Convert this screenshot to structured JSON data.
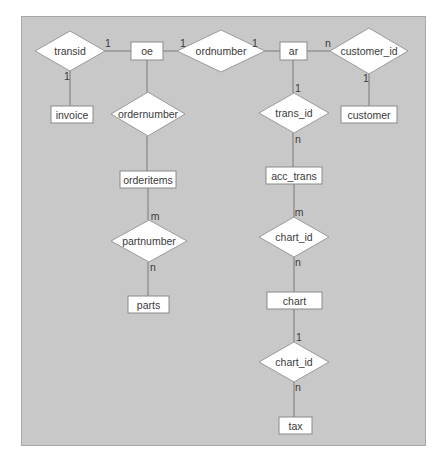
{
  "diagram": {
    "type": "entity-relationship",
    "panel_color": "#c8c8c8",
    "entities": [
      {
        "id": "oe",
        "label": "oe",
        "x": 131,
        "y": 42,
        "w": 32,
        "h": 18
      },
      {
        "id": "ar",
        "label": "ar",
        "x": 280,
        "y": 42,
        "w": 27,
        "h": 18
      },
      {
        "id": "invoice",
        "label": "invoice",
        "x": 51,
        "y": 106,
        "w": 42,
        "h": 17
      },
      {
        "id": "customer",
        "label": "customer",
        "x": 341,
        "y": 106,
        "w": 56,
        "h": 17
      },
      {
        "id": "orderitems",
        "label": "orderitems",
        "x": 120,
        "y": 171,
        "w": 56,
        "h": 17
      },
      {
        "id": "acc_trans",
        "label": "acc_trans",
        "x": 266,
        "y": 167,
        "w": 56,
        "h": 17
      },
      {
        "id": "parts",
        "label": "parts",
        "x": 128,
        "y": 296,
        "w": 41,
        "h": 17
      },
      {
        "id": "chart",
        "label": "chart",
        "x": 267,
        "y": 292,
        "w": 55,
        "h": 17
      },
      {
        "id": "tax",
        "label": "tax",
        "x": 279,
        "y": 417,
        "w": 33,
        "h": 17
      }
    ],
    "relationships": [
      {
        "id": "rel_transid",
        "label": "transid",
        "cx": 70,
        "cy": 51,
        "w": 70,
        "h": 40
      },
      {
        "id": "rel_ordnumber",
        "label": "ordnumber",
        "cx": 221,
        "cy": 51,
        "w": 88,
        "h": 42
      },
      {
        "id": "rel_customer_id",
        "label": "customer_id",
        "cx": 369,
        "cy": 51,
        "w": 78,
        "h": 46
      },
      {
        "id": "rel_ordernumber",
        "label": "ordernumber",
        "cx": 148,
        "cy": 114,
        "w": 74,
        "h": 44
      },
      {
        "id": "rel_trans_id",
        "label": "trans_id",
        "cx": 294,
        "cy": 113,
        "w": 70,
        "h": 40
      },
      {
        "id": "rel_partnumber",
        "label": "partnumber",
        "cx": 149,
        "cy": 241,
        "w": 76,
        "h": 42
      },
      {
        "id": "rel_chart_id_1",
        "label": "chart_id",
        "cx": 294,
        "cy": 237,
        "w": 70,
        "h": 40
      },
      {
        "id": "rel_chart_id_2",
        "label": "chart_id",
        "cx": 294,
        "cy": 362,
        "w": 70,
        "h": 40
      }
    ],
    "edges": [
      {
        "x1": 105,
        "y1": 51,
        "x2": 131,
        "y2": 51
      },
      {
        "x1": 70,
        "y1": 71,
        "x2": 70,
        "y2": 106
      },
      {
        "x1": 163,
        "y1": 51,
        "x2": 177,
        "y2": 51
      },
      {
        "x1": 265,
        "y1": 51,
        "x2": 280,
        "y2": 51
      },
      {
        "x1": 307,
        "y1": 51,
        "x2": 330,
        "y2": 51
      },
      {
        "x1": 369,
        "y1": 74,
        "x2": 369,
        "y2": 106
      },
      {
        "x1": 147,
        "y1": 60,
        "x2": 147,
        "y2": 92
      },
      {
        "x1": 147,
        "y1": 136,
        "x2": 147,
        "y2": 171
      },
      {
        "x1": 293,
        "y1": 60,
        "x2": 293,
        "y2": 93
      },
      {
        "x1": 293,
        "y1": 133,
        "x2": 293,
        "y2": 167
      },
      {
        "x1": 148,
        "y1": 188,
        "x2": 148,
        "y2": 220
      },
      {
        "x1": 148,
        "y1": 262,
        "x2": 148,
        "y2": 296
      },
      {
        "x1": 294,
        "y1": 184,
        "x2": 294,
        "y2": 217
      },
      {
        "x1": 294,
        "y1": 257,
        "x2": 294,
        "y2": 292
      },
      {
        "x1": 294,
        "y1": 309,
        "x2": 294,
        "y2": 342
      },
      {
        "x1": 294,
        "y1": 382,
        "x2": 294,
        "y2": 417
      }
    ],
    "cardinalities": [
      {
        "label": "1",
        "x": 108,
        "y": 43
      },
      {
        "label": "1",
        "x": 67,
        "y": 76
      },
      {
        "label": "1",
        "x": 183,
        "y": 43
      },
      {
        "label": "1",
        "x": 255,
        "y": 43
      },
      {
        "label": "n",
        "x": 328,
        "y": 43
      },
      {
        "label": "1",
        "x": 366,
        "y": 78
      },
      {
        "label": "1",
        "x": 298,
        "y": 88
      },
      {
        "label": "n",
        "x": 298,
        "y": 139
      },
      {
        "label": "m",
        "x": 155,
        "y": 216
      },
      {
        "label": "n",
        "x": 153,
        "y": 267
      },
      {
        "label": "m",
        "x": 299,
        "y": 212
      },
      {
        "label": "n",
        "x": 298,
        "y": 262
      },
      {
        "label": "1",
        "x": 299,
        "y": 337
      },
      {
        "label": "n",
        "x": 298,
        "y": 387
      }
    ]
  }
}
